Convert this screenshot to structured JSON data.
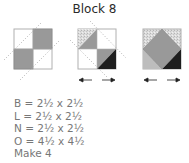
{
  "title": "Block 8",
  "colors": {
    "outline": "#b0b0b0",
    "medium_gray": "#999999",
    "dark": "#1e1e1e",
    "speckled": "#d4d4d4",
    "light_gray": "#bdbdbd",
    "dotted_line": "#a8a8a8",
    "arrow": "#222222"
  },
  "steps": [
    {
      "name": "four-patch",
      "description": "Two medium-gray squares and two white squares with dotted diagonal seam lines"
    },
    {
      "name": "stitch-and-flip",
      "description": "Half-square triangles added to corners, with press arrows"
    },
    {
      "name": "finished-square-in-square",
      "description": "Finished unit with center gray diamond, with press arrows"
    }
  ],
  "specs": [
    {
      "label": "B",
      "value": "2½ x 2½"
    },
    {
      "label": "L",
      "value": "2½ x 2½"
    },
    {
      "label": "N",
      "value": "2½ x 2½"
    },
    {
      "label": "O",
      "value": "4½ x 4½"
    }
  ],
  "spec_lines": [
    "B = 2½ x 2½",
    "L = 2½ x 2½",
    "N = 2½ x 2½",
    "O = 4½ x 4½"
  ],
  "make": "Make 4"
}
